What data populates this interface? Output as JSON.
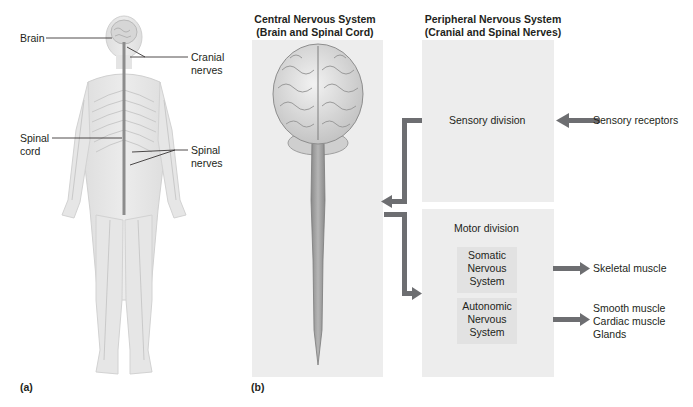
{
  "figure": {
    "panel_a": {
      "letter": "(a)",
      "labels": {
        "brain": "Brain",
        "cranial_nerves_line1": "Cranial",
        "cranial_nerves_line2": "nerves",
        "spinal_cord_line1": "Spinal",
        "spinal_cord_line2": "cord",
        "spinal_nerves_line1": "Spinal",
        "spinal_nerves_line2": "nerves"
      }
    },
    "panel_b": {
      "letter": "(b)",
      "cns": {
        "title_line1": "Central Nervous System",
        "title_line2": "(Brain and Spinal Cord)"
      },
      "pns": {
        "title_line1": "Peripheral Nervous System",
        "title_line2": "(Cranial and Spinal Nerves)",
        "sensory_division": "Sensory division",
        "motor_division": "Motor division",
        "somatic": [
          "Somatic",
          "Nervous",
          "System"
        ],
        "autonomic": [
          "Autonomic",
          "Nervous",
          "System"
        ]
      },
      "inputs": {
        "sensory_receptors": "Sensory receptors"
      },
      "outputs": {
        "skeletal_muscle": "Skeletal muscle",
        "autonomic_targets": [
          "Smooth muscle",
          "Cardiac muscle",
          "Glands"
        ]
      }
    },
    "colors": {
      "arrow": "#6d6e71",
      "panel_bg": "#ededed",
      "subpanel_bg": "#e2e2e2",
      "text": "#231f20",
      "spinal_cord": "#8c8c8c"
    }
  }
}
